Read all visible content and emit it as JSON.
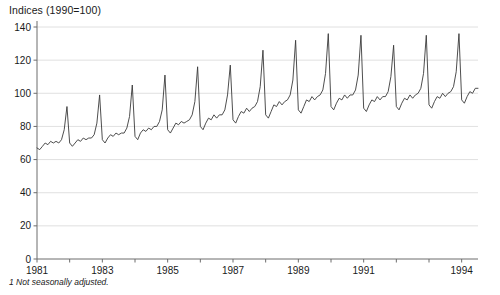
{
  "chart_data": {
    "type": "line",
    "title": "Indices (1990=100)",
    "xlabel": "",
    "ylabel": "",
    "ylim": [
      0,
      140
    ],
    "xlim": [
      1981.0,
      1994.5
    ],
    "grid": true,
    "legend": "none",
    "y_ticks": [
      0,
      20,
      40,
      60,
      80,
      100,
      120,
      140
    ],
    "x_ticks": [
      1981,
      1982,
      1983,
      1984,
      1985,
      1986,
      1987,
      1988,
      1989,
      1990,
      1991,
      1992,
      1993,
      1994
    ],
    "x_tick_labels": [
      "1981",
      "",
      "1983",
      "",
      "1985",
      "",
      "1987",
      "",
      "1989",
      "",
      "1991",
      "",
      "",
      "1994"
    ],
    "annotations": [
      "1  Not seasonally adjusted."
    ],
    "series": [
      {
        "name": "Retail sales index",
        "color": "#3a3a3a",
        "x": [
          1981.0,
          1981.083,
          1981.167,
          1981.25,
          1981.333,
          1981.417,
          1981.5,
          1981.583,
          1981.667,
          1981.75,
          1981.833,
          1981.917,
          1982.0,
          1982.083,
          1982.167,
          1982.25,
          1982.333,
          1982.417,
          1982.5,
          1982.583,
          1982.667,
          1982.75,
          1982.833,
          1982.917,
          1983.0,
          1983.083,
          1983.167,
          1983.25,
          1983.333,
          1983.417,
          1983.5,
          1983.583,
          1983.667,
          1983.75,
          1983.833,
          1983.917,
          1984.0,
          1984.083,
          1984.167,
          1984.25,
          1984.333,
          1984.417,
          1984.5,
          1984.583,
          1984.667,
          1984.75,
          1984.833,
          1984.917,
          1985.0,
          1985.083,
          1985.167,
          1985.25,
          1985.333,
          1985.417,
          1985.5,
          1985.583,
          1985.667,
          1985.75,
          1985.833,
          1985.917,
          1986.0,
          1986.083,
          1986.167,
          1986.25,
          1986.333,
          1986.417,
          1986.5,
          1986.583,
          1986.667,
          1986.75,
          1986.833,
          1986.917,
          1987.0,
          1987.083,
          1987.167,
          1987.25,
          1987.333,
          1987.417,
          1987.5,
          1987.583,
          1987.667,
          1987.75,
          1987.833,
          1987.917,
          1988.0,
          1988.083,
          1988.167,
          1988.25,
          1988.333,
          1988.417,
          1988.5,
          1988.583,
          1988.667,
          1988.75,
          1988.833,
          1988.917,
          1989.0,
          1989.083,
          1989.167,
          1989.25,
          1989.333,
          1989.417,
          1989.5,
          1989.583,
          1989.667,
          1989.75,
          1989.833,
          1989.917,
          1990.0,
          1990.083,
          1990.167,
          1990.25,
          1990.333,
          1990.417,
          1990.5,
          1990.583,
          1990.667,
          1990.75,
          1990.833,
          1990.917,
          1991.0,
          1991.083,
          1991.167,
          1991.25,
          1991.333,
          1991.417,
          1991.5,
          1991.583,
          1991.667,
          1991.75,
          1991.833,
          1991.917,
          1992.0,
          1992.083,
          1992.167,
          1992.25,
          1992.333,
          1992.417,
          1992.5,
          1992.583,
          1992.667,
          1992.75,
          1992.833,
          1992.917,
          1993.0,
          1993.083,
          1993.167,
          1993.25,
          1993.333,
          1993.417,
          1993.5,
          1993.583,
          1993.667,
          1993.75,
          1993.833,
          1993.917,
          1994.0,
          1994.083,
          1994.167,
          1994.25,
          1994.333,
          1994.417,
          1994.5
        ],
        "values": [
          67,
          66,
          68,
          70,
          69,
          71,
          70,
          71,
          70,
          72,
          78,
          92,
          70,
          68,
          70,
          72,
          71,
          73,
          72,
          73,
          73,
          75,
          82,
          99,
          72,
          70,
          73,
          75,
          74,
          76,
          75,
          76,
          76,
          79,
          86,
          105,
          74,
          72,
          76,
          78,
          77,
          79,
          78,
          80,
          80,
          83,
          90,
          111,
          78,
          76,
          79,
          82,
          81,
          83,
          82,
          83,
          84,
          87,
          95,
          116,
          80,
          78,
          82,
          85,
          84,
          87,
          85,
          87,
          87,
          90,
          99,
          117,
          84,
          82,
          86,
          89,
          88,
          91,
          89,
          91,
          92,
          95,
          104,
          126,
          87,
          85,
          89,
          93,
          92,
          95,
          93,
          95,
          96,
          99,
          108,
          132,
          90,
          88,
          92,
          96,
          95,
          98,
          96,
          98,
          99,
          102,
          112,
          136,
          92,
          90,
          94,
          97,
          96,
          99,
          97,
          99,
          99,
          102,
          111,
          135,
          91,
          89,
          93,
          96,
          95,
          98,
          96,
          98,
          98,
          101,
          110,
          129,
          92,
          90,
          94,
          97,
          96,
          99,
          97,
          99,
          100,
          103,
          112,
          135,
          93,
          91,
          95,
          98,
          97,
          100,
          98,
          100,
          101,
          104,
          113,
          136,
          96,
          94,
          98,
          101,
          100,
          103,
          103
        ]
      }
    ]
  }
}
